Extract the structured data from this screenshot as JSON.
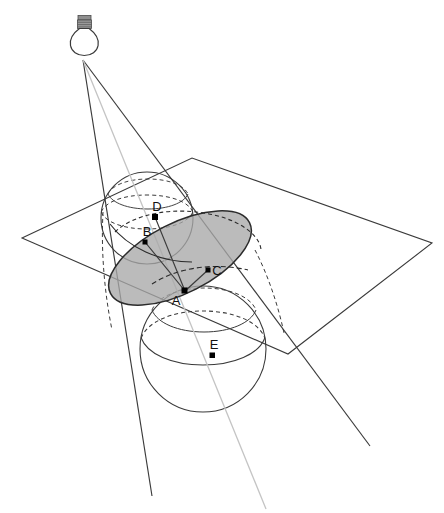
{
  "figure": {
    "background_color": "#ffffff",
    "stroke_color": "#3a3a3a",
    "light_stroke_color": "#b8b8b8",
    "ellipse_fill": "#a8a8a8",
    "point_color": "#000000",
    "width": 444,
    "height": 513
  },
  "light_source": {
    "name": "light-bulb",
    "glass_center_x": 84,
    "glass_center_y": 40,
    "glass_radius": 13,
    "base_x": 78,
    "base_y": 17,
    "base_width": 13,
    "base_height": 11
  },
  "cone": {
    "apex_x": 83,
    "apex_y": 60,
    "left_edge_end_x": 152,
    "left_edge_end_y": 496,
    "right_edge_end_x": 370,
    "right_edge_end_y": 446,
    "axis_end_x": 266,
    "axis_end_y": 509
  },
  "plane": {
    "name": "cutting-plane",
    "vertices": [
      {
        "x": 22,
        "y": 238
      },
      {
        "x": 192,
        "y": 158
      },
      {
        "x": 432,
        "y": 243
      },
      {
        "x": 288,
        "y": 354
      }
    ]
  },
  "spheres": [
    {
      "name": "upper-dandelin-sphere",
      "cx": 147,
      "cy": 218,
      "r": 46
    },
    {
      "name": "lower-dandelin-sphere",
      "cx": 203,
      "cy": 349,
      "r": 63
    }
  ],
  "conic_section": {
    "name": "ellipse-cross-section",
    "cx": 180,
    "cy": 258,
    "rx": 78,
    "ry": 35,
    "rotation_deg": -27,
    "fill": "#a8a8a8",
    "fill_opacity": 0.75
  },
  "points": [
    {
      "id": "A",
      "label": "A",
      "x": 185,
      "y": 291,
      "label_x": 176,
      "label_y": 305,
      "role": "point-on-ellipse"
    },
    {
      "id": "B",
      "label": "B",
      "x": 145,
      "y": 242,
      "label_x": 139,
      "label_y": 235,
      "role": "tangency-upper-sphere"
    },
    {
      "id": "C",
      "label": "C",
      "x": 208,
      "y": 270,
      "label_x": 215,
      "label_y": 275,
      "role": "focus-lower"
    },
    {
      "id": "D",
      "label": "D",
      "x": 155,
      "y": 217,
      "label_x": 149,
      "label_y": 210,
      "role": "tangency-point-upper"
    },
    {
      "id": "E",
      "label": "E",
      "x": 212,
      "y": 355,
      "label_x": 206,
      "label_y": 348,
      "role": "tangency-lower-sphere"
    }
  ],
  "segments": [
    {
      "name": "segment-A-B",
      "from": "A",
      "to": "B"
    },
    {
      "name": "segment-A-C",
      "from": "A",
      "to": "C"
    },
    {
      "name": "segment-A-D",
      "from": "A",
      "to": "D"
    }
  ]
}
